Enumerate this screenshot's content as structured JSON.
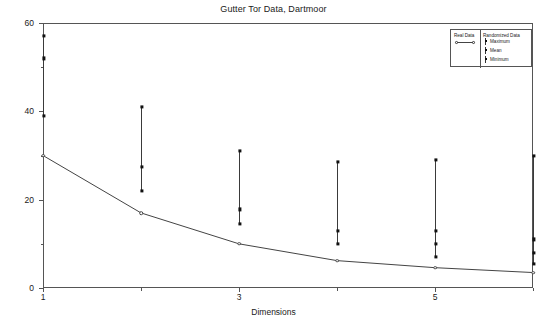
{
  "chart_data": {
    "type": "line",
    "title": "Gutter Tor Data, Dartmoor",
    "xlabel": "Dimensions",
    "ylabel": "Stress",
    "xlim": [
      1,
      6
    ],
    "ylim": [
      0,
      60
    ],
    "grid": false,
    "x": [
      1,
      2,
      3,
      4,
      5,
      6
    ],
    "xticks_major": [
      1,
      3,
      5
    ],
    "xticks_major_labels": [
      "1",
      "3",
      "5"
    ],
    "xticks_minor": [
      2,
      4,
      6
    ],
    "yticks_major": [
      0,
      20,
      40,
      60
    ],
    "yticks_major_labels": [
      "0",
      "20",
      "40",
      "60"
    ],
    "yticks_minor": [
      10,
      30,
      50
    ],
    "legend_position": "top-right",
    "series": [
      {
        "name": "Real Data",
        "style": "line-with-open-circles",
        "values": [
          30.0,
          17.0,
          10.0,
          6.2,
          4.6,
          3.5
        ]
      },
      {
        "name": "Maximum",
        "group": "Randomized Data",
        "style": "square-marker",
        "values": [
          57.0,
          41.0,
          31.0,
          28.5,
          29.0,
          30.0
        ]
      },
      {
        "name": "Mean",
        "group": "Randomized Data",
        "style": "square-marker",
        "values": [
          52.0,
          27.5,
          17.8,
          13.0,
          13.0,
          11.0
        ]
      },
      {
        "name": "Minimum",
        "group": "Randomized Data",
        "style": "square-marker",
        "values": [
          39.0,
          22.0,
          14.5,
          10.0,
          7.0,
          5.5
        ]
      },
      {
        "name": "Extra",
        "group": "Randomized Data",
        "style": "square-marker",
        "values": [
          null,
          null,
          null,
          null,
          10.0,
          8.0
        ]
      }
    ],
    "colors": {
      "axis": "#555555",
      "real_line": "#444444",
      "randomized_marker": "#111111",
      "randomized_bar": "#3a3a3a",
      "text": "#1a1a1a"
    }
  },
  "legend": {
    "real_header": "Real Data",
    "randomized_header": "Randomized Data",
    "entries": [
      {
        "label": "Maximum"
      },
      {
        "label": "Mean"
      },
      {
        "label": "Minimum"
      }
    ]
  }
}
